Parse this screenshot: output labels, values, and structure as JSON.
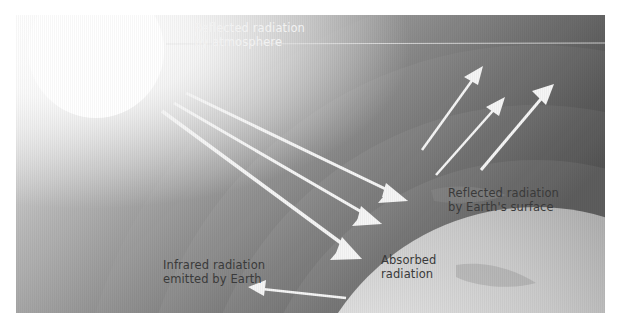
{
  "diagram": {
    "colors": {
      "background_light": "#f4f4f4",
      "background_dark": "#3c3c3c",
      "sun": "#ffffff",
      "earth_light": "#e6e6e6",
      "earth_dark": "#9a9a9a",
      "arrow": "#f5f5f5",
      "label_light": "#f2f2f2",
      "label_dark": "#3a3a3a"
    },
    "labels": {
      "reflected_atmosphere": {
        "line1": "Reflected radiation",
        "line2": "by atmosphere"
      },
      "reflected_surface": {
        "line1": "Reflected radiation",
        "line2": "by Earth's surface"
      },
      "absorbed": {
        "line1": "Absorbed",
        "line2": "radiation"
      },
      "infrared": {
        "line1": "Infrared radiation",
        "line2": "emitted by Earth"
      }
    },
    "elements": {
      "sun": "sun",
      "earth": "earth",
      "atmosphere_layers": 4,
      "incoming_arrows": 3,
      "reflected_surface_arrows": 3,
      "infrared_arrows": 1
    }
  }
}
